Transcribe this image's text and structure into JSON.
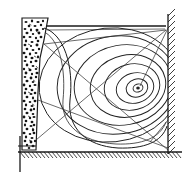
{
  "figure": {
    "caption": "",
    "background_color": "#ffffff",
    "ink_color": "#1a1a1a",
    "line_color": "#222222",
    "faint_color": "#e9e9e9",
    "domain": {
      "left": 22,
      "right": 170,
      "top": 20,
      "bottom": 152
    }
  },
  "regions": {
    "granular_zone": {
      "label": "stippled granular material",
      "fill": "#ffffff",
      "speckle_color": "#1a1a1a",
      "speckle_count": 150,
      "outline": "22,18 48,18 44,40 40,58 38,92 37,120 36,150 22,150"
    },
    "free_surface": {
      "label": "free surface line",
      "y": 26,
      "x_start": 46,
      "x_end": 166
    },
    "right_wall": {
      "label": "hatched right wall",
      "x": 168,
      "y_top": 14,
      "y_bottom": 154,
      "hatch_count": 22
    },
    "bottom_wall": {
      "label": "hatched bottom wall",
      "y": 152,
      "x_start": 18,
      "x_end": 182,
      "hatch_count": 46
    },
    "left_post": {
      "label": "vertical post below bottom wall",
      "x": 20,
      "y_top": 136,
      "y_bottom": 172
    }
  },
  "chart_data": {
    "type": "line",
    "xlabel": "",
    "ylabel": "",
    "legend": [],
    "grid": false,
    "vortex_center": {
      "x": 138,
      "y": 88
    },
    "contour_levels": [
      1,
      2,
      3,
      4,
      5,
      6,
      7,
      8
    ],
    "contour_rings": [
      {
        "level": 8,
        "rx": 5,
        "ry": 4,
        "cx": 138,
        "cy": 88,
        "rot": -18
      },
      {
        "level": 7,
        "rx": 11,
        "ry": 9,
        "cx": 137,
        "cy": 88,
        "rot": -18
      },
      {
        "level": 6,
        "rx": 19,
        "ry": 15,
        "cx": 135,
        "cy": 88,
        "rot": -16
      },
      {
        "level": 5,
        "rx": 28,
        "ry": 23,
        "cx": 132,
        "cy": 87,
        "rot": -14
      },
      {
        "level": 4,
        "rx": 38,
        "ry": 31,
        "cx": 128,
        "cy": 86,
        "rot": -12
      },
      {
        "level": 3,
        "rx": 49,
        "ry": 40,
        "cx": 123,
        "cy": 85,
        "rot": -10
      },
      {
        "level": 2,
        "rx": 60,
        "ry": 49,
        "cx": 117,
        "cy": 85,
        "rot": -8
      },
      {
        "level": 1,
        "rx": 71,
        "ry": 57,
        "cx": 110,
        "cy": 85,
        "rot": -6
      }
    ],
    "radial_lines": [
      {
        "name": "radial-upper",
        "x1": 44,
        "y1": 44,
        "x2": 166,
        "y2": 30
      },
      {
        "name": "radial-center",
        "x1": 44,
        "y1": 44,
        "x2": 168,
        "y2": 150
      },
      {
        "name": "radial-lower",
        "x1": 38,
        "y1": 100,
        "x2": 168,
        "y2": 148
      },
      {
        "name": "radial-diagonal",
        "x1": 36,
        "y1": 140,
        "x2": 166,
        "y2": 30
      },
      {
        "name": "radial-short",
        "x1": 140,
        "y1": 86,
        "x2": 168,
        "y2": 28
      }
    ],
    "boundary_streamline": {
      "name": "outer separating streamline",
      "path": "M 44,28 C 64,34 74,66 70,100 C 67,128 86,146 118,148 C 144,149 162,142 167,126"
    }
  },
  "annotations": {
    "figure_number": "",
    "notes": ""
  }
}
